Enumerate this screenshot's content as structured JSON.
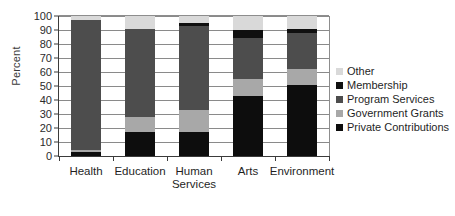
{
  "chart_data": {
    "type": "bar",
    "stacked": true,
    "title": "",
    "xlabel": "",
    "ylabel": "Percent",
    "ylim": [
      0,
      100
    ],
    "ytick_labels": [
      "0",
      "10",
      "20",
      "30",
      "40",
      "50",
      "60",
      "70",
      "80",
      "90",
      "100"
    ],
    "yticks": [
      0,
      10,
      20,
      30,
      40,
      50,
      60,
      70,
      80,
      90,
      100
    ],
    "grid": true,
    "legend_position": "right",
    "categories": [
      "Health",
      "Education",
      "Human Services",
      "Arts",
      "Environment"
    ],
    "category_labels": [
      "Health",
      "Education",
      "Human\nServices",
      "Arts",
      "Environment"
    ],
    "series": [
      {
        "name": "Private Contributions",
        "color": "#0d0d0d",
        "values": [
          3,
          17,
          17,
          43,
          51
        ]
      },
      {
        "name": "Government Grants",
        "color": "#a8a8a8",
        "values": [
          1,
          11,
          16,
          12,
          11
        ]
      },
      {
        "name": "Program Services",
        "color": "#4d4d4d",
        "values": [
          93,
          63,
          60,
          29,
          26
        ]
      },
      {
        "name": "Membership",
        "color": "#101010",
        "values": [
          0,
          0,
          2,
          6,
          3
        ]
      },
      {
        "name": "Other",
        "color": "#d9d9d9",
        "values": [
          3,
          9,
          5,
          10,
          9
        ]
      }
    ],
    "legend_entries": [
      {
        "label": "Other",
        "color": "#d9d9d9"
      },
      {
        "label": "Membership",
        "color": "#101010"
      },
      {
        "label": "Program Services",
        "color": "#4d4d4d"
      },
      {
        "label": "Government Grants",
        "color": "#a8a8a8"
      },
      {
        "label": "Private Contributions",
        "color": "#0d0d0d"
      }
    ]
  }
}
